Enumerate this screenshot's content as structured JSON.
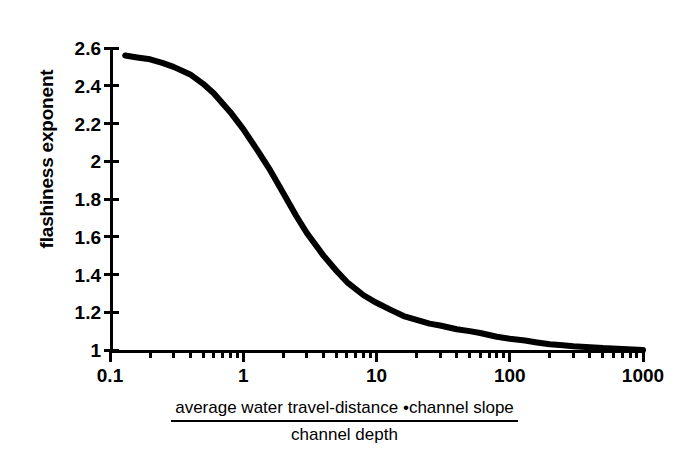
{
  "chart_data": {
    "type": "line",
    "title": "",
    "subtitle": "",
    "xlabel_numerator": "average water travel-distance •channel slope",
    "xlabel_denominator": "channel depth",
    "ylabel": "flashiness exponent",
    "xscale": "log",
    "yscale": "linear",
    "xlim": [
      0.1,
      1000
    ],
    "ylim": [
      1,
      2.6
    ],
    "grid": false,
    "legend": "none",
    "line_color": "#000000",
    "background_color": "#ffffff",
    "x_major_ticks": [
      0.1,
      1,
      10,
      100,
      1000
    ],
    "x_tick_labels": [
      "0.1",
      "1",
      "10",
      "100",
      "1000"
    ],
    "x_minor_ticks": [
      0.2,
      0.3,
      0.4,
      0.5,
      0.6,
      0.7,
      0.8,
      0.9,
      2,
      3,
      4,
      5,
      6,
      7,
      8,
      9,
      20,
      30,
      40,
      50,
      60,
      70,
      80,
      90,
      200,
      300,
      400,
      500,
      600,
      700,
      800,
      900
    ],
    "y_ticks": [
      1,
      1.2,
      1.4,
      1.6,
      1.8,
      2,
      2.2,
      2.4,
      2.6
    ],
    "y_tick_labels": [
      "1",
      "1.2",
      "1.4",
      "1.6",
      "1.8",
      "2",
      "2.2",
      "2.4",
      "2.6"
    ],
    "series": [
      {
        "name": "flashiness exponent",
        "x": [
          0.13,
          0.16,
          0.2,
          0.25,
          0.3,
          0.4,
          0.5,
          0.6,
          0.8,
          1.0,
          1.3,
          1.6,
          2.0,
          2.5,
          3.0,
          4.0,
          5.0,
          6.0,
          8.0,
          10.0,
          13.0,
          16.0,
          20.0,
          25.0,
          30.0,
          40.0,
          50.0,
          60.0,
          80.0,
          100.0,
          130.0,
          160.0,
          200.0,
          250.0,
          300.0,
          400.0,
          500.0,
          700.0,
          1000.0
        ],
        "y": [
          2.56,
          2.55,
          2.54,
          2.52,
          2.5,
          2.46,
          2.41,
          2.36,
          2.26,
          2.17,
          2.05,
          1.95,
          1.83,
          1.71,
          1.62,
          1.5,
          1.42,
          1.36,
          1.29,
          1.25,
          1.21,
          1.18,
          1.16,
          1.14,
          1.13,
          1.11,
          1.1,
          1.09,
          1.07,
          1.06,
          1.05,
          1.04,
          1.03,
          1.025,
          1.02,
          1.015,
          1.01,
          1.005,
          1.0
        ]
      }
    ]
  },
  "axes": {
    "y_title": "flashiness exponent",
    "x_fraction": {
      "numerator": "average water travel-distance •channel slope",
      "denominator": "channel depth"
    }
  }
}
